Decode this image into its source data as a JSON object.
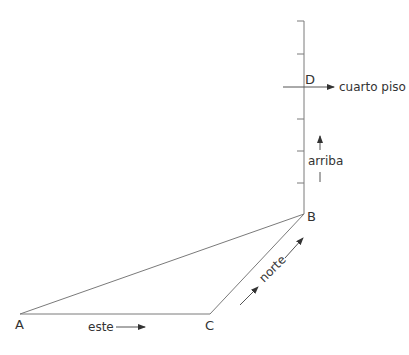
{
  "diagram": {
    "vertices": {
      "A": {
        "label": "A"
      },
      "B": {
        "label": "B"
      },
      "C": {
        "label": "C"
      },
      "D": {
        "label": "D"
      }
    },
    "labels": {
      "east": "este",
      "north": "norte",
      "up": "arriba",
      "fourth_floor": "cuarto piso"
    },
    "colors": {
      "line": "#7a7a7a",
      "text": "#333333"
    }
  }
}
